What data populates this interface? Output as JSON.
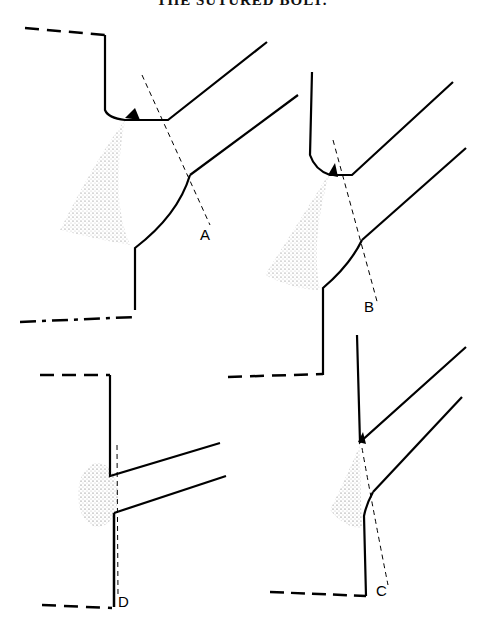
{
  "title": "THE SUTURED BOLT.",
  "figures": [
    {
      "id": "A",
      "label": "A",
      "description": "Branch joining main vessel at acute angle with wide curved heel; dashed cut line"
    },
    {
      "id": "B",
      "label": "B",
      "description": "Branch joining main vessel at acute angle with curved heel; dashed cut line"
    },
    {
      "id": "C",
      "label": "C",
      "description": "Branch joining main vessel at acute angle, narrow angled heel; dashed cut line"
    },
    {
      "id": "D",
      "label": "D",
      "description": "Branch joining main vessel nearly perpendicular; dashed cut line parallel to wall"
    }
  ],
  "colors": {
    "ink": "#000000",
    "background": "#ffffff"
  }
}
